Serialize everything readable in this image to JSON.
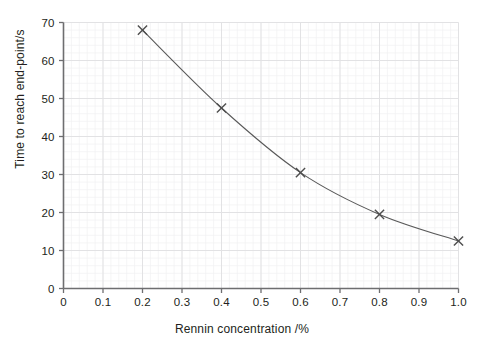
{
  "chart_data": {
    "type": "line",
    "title": "",
    "xlabel": "Rennin concentration /%",
    "ylabel": "Time to reach end-point/s",
    "xlim": [
      0,
      1.0
    ],
    "ylim": [
      0,
      70
    ],
    "grid": true,
    "grid_minor": true,
    "legend": null,
    "marker": "x-cross",
    "line_color": "#595959",
    "marker_color": "#4d4d4d",
    "grid_major_color": "#e2e2e4",
    "grid_minor_color": "#f0f0f2",
    "axis_color": "#6e6e70",
    "xticks": [
      "0",
      "0.1",
      "0.2",
      "0.3",
      "0.4",
      "0.5",
      "0.6",
      "0.7",
      "0.8",
      "0.9",
      "1.0"
    ],
    "xtick_values": [
      0,
      0.1,
      0.2,
      0.3,
      0.4,
      0.5,
      0.6,
      0.7,
      0.8,
      0.9,
      1.0
    ],
    "yticks": [
      "0",
      "10",
      "20",
      "30",
      "40",
      "50",
      "60",
      "70"
    ],
    "ytick_values": [
      0,
      10,
      20,
      30,
      40,
      50,
      60,
      70
    ],
    "x": [
      0.2,
      0.4,
      0.6,
      0.8,
      1.0
    ],
    "values": [
      68,
      47.5,
      30.5,
      19.5,
      12.5
    ],
    "points": [
      {
        "x": 0.2,
        "y": 68
      },
      {
        "x": 0.4,
        "y": 47.5
      },
      {
        "x": 0.6,
        "y": 30.5
      },
      {
        "x": 0.8,
        "y": 19.5
      },
      {
        "x": 1.0,
        "y": 12.5
      }
    ]
  }
}
